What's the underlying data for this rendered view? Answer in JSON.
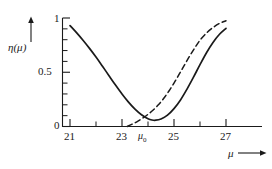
{
  "chart_data": {
    "type": "line",
    "title": "",
    "xlabel": "μ",
    "ylabel": "η(μ)",
    "xlim": [
      20.6,
      27.8
    ],
    "ylim": [
      0,
      1.05
    ],
    "grid": false,
    "legend": "none",
    "x_ticks_major": [
      21,
      23,
      25,
      27
    ],
    "x_ticks_minor": [
      22,
      24,
      26
    ],
    "x_tick_labels": [
      "21",
      "23",
      "25",
      "27"
    ],
    "y_ticks_major": [
      0,
      0.5,
      1
    ],
    "y_tick_labels": [
      "0",
      "0.5",
      "1"
    ],
    "y_ticks_minor": [
      0.1,
      0.2,
      0.3,
      0.4,
      0.6,
      0.7,
      0.8,
      0.9
    ],
    "annotations": [
      {
        "text": "μ",
        "sub": "0",
        "x": 24.05,
        "y": 0,
        "placement": "below-axis"
      }
    ],
    "series": [
      {
        "name": "solid-curve",
        "style": "solid",
        "color": "#1a1a1a",
        "points": [
          [
            21.0,
            0.93
          ],
          [
            21.25,
            0.865
          ],
          [
            21.5,
            0.795
          ],
          [
            21.75,
            0.72
          ],
          [
            22.0,
            0.64
          ],
          [
            22.25,
            0.555
          ],
          [
            22.5,
            0.468
          ],
          [
            22.75,
            0.382
          ],
          [
            23.0,
            0.3
          ],
          [
            23.25,
            0.225
          ],
          [
            23.5,
            0.16
          ],
          [
            23.75,
            0.108
          ],
          [
            24.0,
            0.072
          ],
          [
            24.15,
            0.06
          ],
          [
            24.3,
            0.058
          ],
          [
            24.5,
            0.07
          ],
          [
            24.75,
            0.105
          ],
          [
            25.0,
            0.165
          ],
          [
            25.25,
            0.245
          ],
          [
            25.5,
            0.345
          ],
          [
            25.75,
            0.455
          ],
          [
            26.0,
            0.57
          ],
          [
            26.25,
            0.68
          ],
          [
            26.5,
            0.775
          ],
          [
            26.75,
            0.85
          ],
          [
            27.0,
            0.905
          ]
        ]
      },
      {
        "name": "dashed-curve",
        "style": "dashed",
        "color": "#1a1a1a",
        "points": [
          [
            23.2,
            0.0
          ],
          [
            23.4,
            0.022
          ],
          [
            23.6,
            0.048
          ],
          [
            23.8,
            0.078
          ],
          [
            24.0,
            0.112
          ],
          [
            24.2,
            0.152
          ],
          [
            24.4,
            0.2
          ],
          [
            24.6,
            0.258
          ],
          [
            24.8,
            0.325
          ],
          [
            25.0,
            0.4
          ],
          [
            25.2,
            0.482
          ],
          [
            25.4,
            0.565
          ],
          [
            25.6,
            0.648
          ],
          [
            25.8,
            0.725
          ],
          [
            26.0,
            0.795
          ],
          [
            26.25,
            0.862
          ],
          [
            26.5,
            0.912
          ],
          [
            26.75,
            0.95
          ],
          [
            27.0,
            0.975
          ]
        ]
      }
    ]
  },
  "axes": {
    "y_axis_arrow": "up-arrow",
    "x_axis_arrow": "right-arrow",
    "y_label_text": "η(μ)",
    "x_label_text": "μ"
  },
  "labels": {
    "y_top": "1",
    "y_mid": "0.5",
    "y_bottom": "0",
    "x1": "21",
    "x2": "23",
    "x3": "25",
    "x4": "27",
    "mu0": "μ",
    "mu0_sub": "0"
  }
}
